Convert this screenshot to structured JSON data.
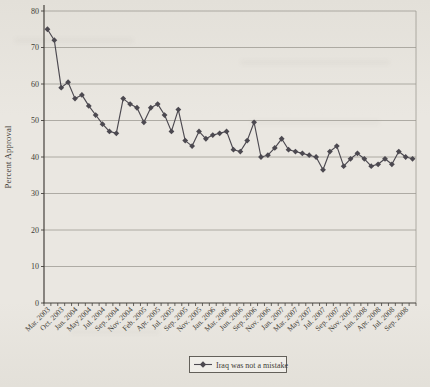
{
  "chart_data": {
    "type": "line",
    "ylabel": "Percent Approval",
    "ylim": [
      0,
      80
    ],
    "yticks": [
      0,
      10,
      20,
      30,
      40,
      50,
      60,
      70,
      80
    ],
    "grid": true,
    "legend_position": "bottom-center",
    "x_label_interval": 2,
    "x_labels": [
      "Mar. 2003",
      "Oct. 2003",
      "Jan. 2004",
      "May 2004",
      "Jul. 2004",
      "Sep. 2004",
      "Nov. 2004",
      "Feb. 2005",
      "Apr. 2005",
      "Jul. 2005",
      "Sep. 2005",
      "Nov. 2005",
      "Jan. 2006",
      "Mar. 2006",
      "Jun. 2006",
      "Sep. 2006",
      "Nov. 2006",
      "Jan. 2007",
      "Mar. 2007",
      "May 2007",
      "Jul. 2007",
      "Sep. 2007",
      "Nov. 2007",
      "Jan. 2008",
      "Apr. 2008",
      "Jul. 2008",
      "Sep. 2008"
    ],
    "series": [
      {
        "name": "Iraq was not a mistake",
        "marker": "diamond",
        "values": [
          75,
          72,
          59,
          60.5,
          56,
          57,
          54,
          51.5,
          49,
          47,
          46.5,
          56,
          54.5,
          53.5,
          49.5,
          53.5,
          54.5,
          51.5,
          47,
          53,
          44.5,
          43,
          47,
          45,
          46,
          46.5,
          47,
          42,
          41.5,
          44.5,
          49.5,
          40,
          40.5,
          42.5,
          45,
          42,
          41.5,
          41,
          40.5,
          40,
          36.5,
          41.5,
          43,
          37.5,
          39.5,
          41,
          39.5,
          37.5,
          38,
          39.5,
          38,
          41.5,
          40,
          39.5
        ]
      }
    ]
  },
  "theme": {
    "series_color": "#4c4950",
    "grid_color": "#9a978f",
    "axis_color": "#45423d",
    "ink_color": "#3e3b35",
    "paper_color": "#eae7e1",
    "paper_dark_color": "#e3e0d9",
    "legend_fill": "#f0eee9",
    "legend_border": "#55524c"
  }
}
